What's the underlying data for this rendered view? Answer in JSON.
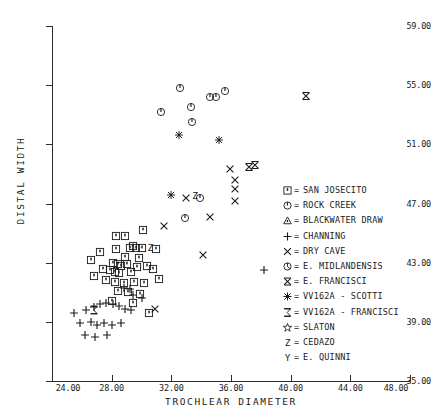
{
  "chart_data": {
    "type": "scatter",
    "title": "",
    "xlabel": "TROCHLEAR DIAMETER",
    "ylabel": "DISTAL WIDTH",
    "xlim": [
      24.0,
      48.0
    ],
    "ylim": [
      35.0,
      59.0
    ],
    "grid": false,
    "legend_position": "right-inside",
    "xticks": [
      "24.00",
      "28.00",
      "32.00",
      "36.00",
      "40.00",
      "44.00",
      "48.00"
    ],
    "xtick_values": [
      24,
      28,
      32,
      36,
      40,
      44,
      48
    ],
    "yticks": [
      "35.00",
      "39.00",
      "43.00",
      "47.00",
      "51.00",
      "55.00",
      "59.00"
    ],
    "ytick_values": [
      35,
      39,
      43,
      47,
      51,
      55,
      59
    ],
    "series": [
      {
        "name": "SAN JOSECITO",
        "symbol": "square-dot",
        "points": [
          [
            28.3,
            44.8
          ],
          [
            28.9,
            44.8
          ],
          [
            30.1,
            45.2
          ],
          [
            29.4,
            44.1
          ],
          [
            27.2,
            43.7
          ],
          [
            28.3,
            43.9
          ],
          [
            29.2,
            44.0
          ],
          [
            29.6,
            44.0
          ],
          [
            30.0,
            44.0
          ],
          [
            31.0,
            43.9
          ],
          [
            26.6,
            43.2
          ],
          [
            28.1,
            43.0
          ],
          [
            28.4,
            42.9
          ],
          [
            28.6,
            42.8
          ],
          [
            29.0,
            42.9
          ],
          [
            29.7,
            42.7
          ],
          [
            30.4,
            42.8
          ],
          [
            27.9,
            42.5
          ],
          [
            28.2,
            42.4
          ],
          [
            28.5,
            42.3
          ],
          [
            29.3,
            42.4
          ],
          [
            27.6,
            41.8
          ],
          [
            28.2,
            41.7
          ],
          [
            28.8,
            41.6
          ],
          [
            29.5,
            41.7
          ],
          [
            30.2,
            41.6
          ],
          [
            31.2,
            41.9
          ],
          [
            28.4,
            41.1
          ],
          [
            29.1,
            41.0
          ],
          [
            29.9,
            40.9
          ],
          [
            28.0,
            40.4
          ],
          [
            29.4,
            40.3
          ],
          [
            30.5,
            39.6
          ],
          [
            26.8,
            42.1
          ],
          [
            27.4,
            42.6
          ],
          [
            28.9,
            43.4
          ],
          [
            29.8,
            43.3
          ],
          [
            30.8,
            42.6
          ]
        ]
      },
      {
        "name": "ROCK CREEK",
        "symbol": "circle-dot",
        "points": [
          [
            32.6,
            54.8
          ],
          [
            35.6,
            54.6
          ],
          [
            34.6,
            54.2
          ],
          [
            35.0,
            54.2
          ],
          [
            33.3,
            53.5
          ],
          [
            31.3,
            53.2
          ],
          [
            33.4,
            52.5
          ],
          [
            33.9,
            47.4
          ],
          [
            32.9,
            46.0
          ]
        ]
      },
      {
        "name": "BLACKWATER DRAW",
        "symbol": "triangle",
        "points": []
      },
      {
        "name": "CHANNING",
        "symbol": "plus",
        "points": [
          [
            25.5,
            39.6
          ],
          [
            26.3,
            39.8
          ],
          [
            26.8,
            40.0
          ],
          [
            27.2,
            40.2
          ],
          [
            27.6,
            40.3
          ],
          [
            28.1,
            40.2
          ],
          [
            28.5,
            40.1
          ],
          [
            28.9,
            39.9
          ],
          [
            29.3,
            39.8
          ],
          [
            25.9,
            38.9
          ],
          [
            26.6,
            39.0
          ],
          [
            27.0,
            38.8
          ],
          [
            27.5,
            38.9
          ],
          [
            28.0,
            38.8
          ],
          [
            28.6,
            38.9
          ],
          [
            26.2,
            38.1
          ],
          [
            26.9,
            38.0
          ],
          [
            27.7,
            38.1
          ],
          [
            29.4,
            40.8
          ],
          [
            30.0,
            40.6
          ],
          [
            28.8,
            41.3
          ],
          [
            29.2,
            41.2
          ],
          [
            38.2,
            42.5
          ]
        ]
      },
      {
        "name": "DRY CAVE",
        "symbol": "X",
        "points": [
          [
            31.5,
            45.5
          ],
          [
            33.0,
            47.4
          ],
          [
            35.9,
            49.3
          ],
          [
            36.3,
            48.6
          ],
          [
            36.3,
            48.0
          ],
          [
            36.3,
            47.2
          ],
          [
            34.6,
            46.1
          ],
          [
            34.1,
            43.5
          ],
          [
            30.9,
            39.9
          ]
        ]
      },
      {
        "name": "E. MIDLANDENSIS",
        "symbol": "circle-marks",
        "points": []
      },
      {
        "name": "E. FRANCISCI",
        "symbol": "X-bar",
        "points": [
          [
            41.0,
            54.3
          ],
          [
            37.2,
            49.5
          ],
          [
            37.6,
            49.6
          ]
        ]
      },
      {
        "name": "VV162A - SCOTTI",
        "symbol": "asterisk",
        "points": [
          [
            32.5,
            51.6
          ],
          [
            35.2,
            51.3
          ],
          [
            32.0,
            47.6
          ]
        ]
      },
      {
        "name": "VV162A - FRANCISCI",
        "symbol": "sigma",
        "points": [
          [
            26.8,
            39.8
          ]
        ]
      },
      {
        "name": "SLATON",
        "symbol": "star",
        "points": []
      },
      {
        "name": "CEDAZO",
        "symbol": "Z",
        "points": [
          [
            30.6,
            44.0
          ],
          [
            33.6,
            47.5
          ]
        ]
      },
      {
        "name": "E. QUINNI",
        "symbol": "Y",
        "points": []
      }
    ]
  },
  "legend": {
    "separator": "=",
    "items": [
      {
        "symbol": "square-dot",
        "label": "SAN JOSECITO"
      },
      {
        "symbol": "circle-dot",
        "label": "ROCK CREEK"
      },
      {
        "symbol": "triangle",
        "label": "BLACKWATER DRAW"
      },
      {
        "symbol": "plus",
        "label": "CHANNING"
      },
      {
        "symbol": "X",
        "label": "DRY CAVE"
      },
      {
        "symbol": "circle-marks",
        "label": "E. MIDLANDENSIS"
      },
      {
        "symbol": "X-bar",
        "label": "E. FRANCISCI"
      },
      {
        "symbol": "asterisk",
        "label": "VV162A - SCOTTI"
      },
      {
        "symbol": "sigma",
        "label": "VV162A - FRANCISCI"
      },
      {
        "symbol": "star",
        "label": "SLATON"
      },
      {
        "symbol": "Z",
        "label": "CEDAZO"
      },
      {
        "symbol": "Y",
        "label": "E. QUINNI"
      }
    ]
  },
  "colors": {
    "ink": "#1a1a1a",
    "axis": "#2b2b2b",
    "background": "#ffffff"
  }
}
